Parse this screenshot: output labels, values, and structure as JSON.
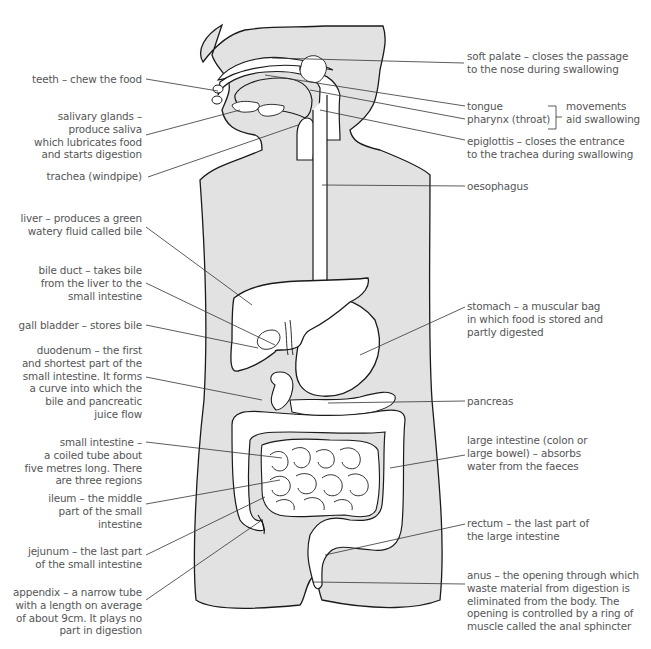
{
  "diagram": {
    "colors": {
      "body_fill": "#e2e2e2",
      "organ_fill": "#ffffff",
      "outline": "#1a1a1a",
      "leader_line": "#333333",
      "label_text": "#555555"
    },
    "labels_left": [
      {
        "id": "teeth",
        "lines": [
          "teeth – chew the food"
        ]
      },
      {
        "id": "salivary-glands",
        "lines": [
          "salivary glands –",
          "produce saliva",
          "which lubricates food",
          "and starts digestion"
        ]
      },
      {
        "id": "trachea",
        "lines": [
          "trachea (windpipe)"
        ]
      },
      {
        "id": "liver",
        "lines": [
          "liver – produces a green",
          "watery fluid called bile"
        ]
      },
      {
        "id": "bile-duct",
        "lines": [
          "bile duct – takes bile",
          "from the liver to the",
          "small intestine"
        ]
      },
      {
        "id": "gall-bladder",
        "lines": [
          "gall bladder – stores bile"
        ]
      },
      {
        "id": "duodenum",
        "lines": [
          "duodenum – the first",
          "and shortest part of the",
          "small intestine. It forms",
          "a curve into which the",
          "bile and pancreatic",
          "juice flow"
        ]
      },
      {
        "id": "small-intestine",
        "lines": [
          "small intestine –",
          "a coiled tube about",
          "five metres long. There",
          "are three regions"
        ]
      },
      {
        "id": "ileum",
        "lines": [
          "ileum – the middle",
          "part of the small",
          "intestine"
        ]
      },
      {
        "id": "jejunum",
        "lines": [
          "jejunum – the last part",
          "of the small intestine"
        ]
      },
      {
        "id": "appendix",
        "lines": [
          "appendix – a narrow tube",
          "with a length on average",
          "of about 9cm. It plays no",
          "part in digestion"
        ]
      }
    ],
    "labels_right": [
      {
        "id": "soft-palate",
        "lines": [
          "soft palate – closes the passage",
          "to the nose during swallowing"
        ]
      },
      {
        "id": "tongue",
        "lines": [
          "tongue"
        ]
      },
      {
        "id": "pharynx",
        "lines": [
          "pharynx (throat)"
        ]
      },
      {
        "id": "movements-note",
        "lines": [
          "movements",
          "aid swallowing"
        ]
      },
      {
        "id": "epiglottis",
        "lines": [
          "epiglottis – closes the entrance",
          "to the trachea during swallowing"
        ]
      },
      {
        "id": "oesophagus",
        "lines": [
          "oesophagus"
        ]
      },
      {
        "id": "stomach",
        "lines": [
          "stomach – a muscular bag",
          "in which food is stored and",
          "partly digested"
        ]
      },
      {
        "id": "pancreas",
        "lines": [
          "pancreas"
        ]
      },
      {
        "id": "large-intestine",
        "lines": [
          "large intestine (colon or",
          "large bowel) – absorbs",
          "water from the faeces"
        ]
      },
      {
        "id": "rectum",
        "lines": [
          "rectum – the last part of",
          "the large intestine"
        ]
      },
      {
        "id": "anus",
        "lines": [
          "anus – the opening through which",
          "waste material from digestion is",
          "eliminated from the body. The",
          "opening is controlled by a ring of",
          "muscle called the anal sphincter"
        ]
      }
    ]
  }
}
